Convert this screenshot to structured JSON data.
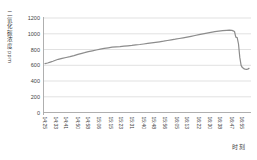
{
  "chart_data": {
    "type": "line",
    "title": "",
    "ylabel": "二氧化碳浓度 ppm",
    "xlabel": "时刻",
    "ylim": [
      0,
      1200
    ],
    "ytick_interval": 200,
    "yticks": [
      0,
      200,
      400,
      600,
      800,
      1000,
      1200
    ],
    "xticks": [
      "14:25",
      "14:33",
      "14:41",
      "14:50",
      "14:58",
      "15:06",
      "15:15",
      "15:23",
      "15:31",
      "15:40",
      "15:48",
      "15:56",
      "16:05",
      "16:13",
      "16:22",
      "16:30",
      "16:38",
      "16:47",
      "16:55"
    ],
    "x_range": [
      "14:25",
      "17:00"
    ],
    "grid": "horizontal",
    "legend": "none",
    "line_color": "#8c8c8c",
    "gridline_color": "#d9d9d9",
    "axis_color": "#a6a6a6",
    "tick_label_color": "#3f3f3f",
    "series": [
      {
        "name": "二氧化碳浓度",
        "unit": "ppm",
        "points": [
          [
            "14:25",
            620
          ],
          [
            "14:27",
            628
          ],
          [
            "14:29",
            640
          ],
          [
            "14:31",
            652
          ],
          [
            "14:33",
            664
          ],
          [
            "14:35",
            676
          ],
          [
            "14:38",
            688
          ],
          [
            "14:41",
            698
          ],
          [
            "14:44",
            708
          ],
          [
            "14:47",
            722
          ],
          [
            "14:50",
            738
          ],
          [
            "14:53",
            752
          ],
          [
            "14:55",
            760
          ],
          [
            "14:58",
            772
          ],
          [
            "15:01",
            783
          ],
          [
            "15:04",
            794
          ],
          [
            "15:07",
            805
          ],
          [
            "15:10",
            814
          ],
          [
            "15:13",
            822
          ],
          [
            "15:16",
            829
          ],
          [
            "15:19",
            833
          ],
          [
            "15:22",
            837
          ],
          [
            "15:25",
            842
          ],
          [
            "15:28",
            847
          ],
          [
            "15:31",
            852
          ],
          [
            "15:34",
            858
          ],
          [
            "15:37",
            864
          ],
          [
            "15:40",
            870
          ],
          [
            "15:43",
            877
          ],
          [
            "15:46",
            884
          ],
          [
            "15:49",
            891
          ],
          [
            "15:52",
            898
          ],
          [
            "15:55",
            906
          ],
          [
            "15:58",
            914
          ],
          [
            "16:01",
            923
          ],
          [
            "16:04",
            931
          ],
          [
            "16:07",
            940
          ],
          [
            "16:10",
            949
          ],
          [
            "16:13",
            958
          ],
          [
            "16:16",
            968
          ],
          [
            "16:19",
            978
          ],
          [
            "16:22",
            989
          ],
          [
            "16:25",
            999
          ],
          [
            "16:28",
            1008
          ],
          [
            "16:31",
            1017
          ],
          [
            "16:34",
            1026
          ],
          [
            "16:37",
            1033
          ],
          [
            "16:40",
            1039
          ],
          [
            "16:43",
            1044
          ],
          [
            "16:45",
            1045
          ],
          [
            "16:47",
            1042
          ],
          [
            "16:48",
            1036
          ],
          [
            "16:49",
            1028
          ],
          [
            "16:50",
            958
          ],
          [
            "16:51",
            951
          ],
          [
            "16:52",
            870
          ],
          [
            "16:53",
            700
          ],
          [
            "16:54",
            598
          ],
          [
            "16:55",
            570
          ],
          [
            "16:56",
            558
          ],
          [
            "16:57",
            551
          ],
          [
            "16:58",
            548
          ],
          [
            "16:59",
            551
          ],
          [
            "17:00",
            560
          ]
        ]
      }
    ]
  }
}
